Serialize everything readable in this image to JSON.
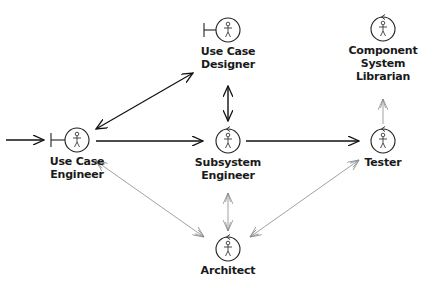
{
  "diagram": {
    "title": "",
    "colors": {
      "strong_line": "#111111",
      "weak_line": "#8a8a8a",
      "text": "#1a1a1a"
    },
    "nodes": [
      {
        "id": "use-case-engineer",
        "label_lines": [
          "Use Case",
          "Engineer"
        ],
        "stereotype": "boundary",
        "cx": 77,
        "cy": 140,
        "label_y": 156
      },
      {
        "id": "use-case-designer",
        "label_lines": [
          "Use Case",
          "Designer"
        ],
        "stereotype": "boundary",
        "cx": 228,
        "cy": 30,
        "label_y": 47
      },
      {
        "id": "subsystem-engineer",
        "label_lines": [
          "Subsystem",
          "Engineer"
        ],
        "stereotype": "control",
        "cx": 228,
        "cy": 141,
        "label_y": 156
      },
      {
        "id": "component-system-librarian",
        "label_lines": [
          "Component",
          "System",
          "Librarian"
        ],
        "stereotype": "control",
        "cx": 383,
        "cy": 29,
        "label_y": 45
      },
      {
        "id": "tester",
        "label_lines": [
          "Tester"
        ],
        "stereotype": "control",
        "cx": 383,
        "cy": 141,
        "label_y": 156
      },
      {
        "id": "architect",
        "label_lines": [
          "Architect"
        ],
        "stereotype": "control",
        "cx": 228,
        "cy": 249,
        "label_y": 264
      }
    ],
    "edges": [
      {
        "from": "external",
        "to": "use-case-engineer",
        "style": "strong",
        "direction": "forward"
      },
      {
        "from": "use-case-engineer",
        "to": "use-case-designer",
        "style": "strong",
        "direction": "both"
      },
      {
        "from": "use-case-engineer",
        "to": "subsystem-engineer",
        "style": "strong",
        "direction": "forward"
      },
      {
        "from": "use-case-designer",
        "to": "subsystem-engineer",
        "style": "strong",
        "direction": "both"
      },
      {
        "from": "subsystem-engineer",
        "to": "tester",
        "style": "strong",
        "direction": "forward"
      },
      {
        "from": "tester",
        "to": "component-system-librarian",
        "style": "weak",
        "direction": "forward"
      },
      {
        "from": "use-case-engineer",
        "to": "architect",
        "style": "weak",
        "direction": "both"
      },
      {
        "from": "subsystem-engineer",
        "to": "architect",
        "style": "weak",
        "direction": "both"
      },
      {
        "from": "tester",
        "to": "architect",
        "style": "weak",
        "direction": "both"
      }
    ]
  },
  "labels": {
    "uce_1": "Use Case",
    "uce_2": "Engineer",
    "ucd_1": "Use Case",
    "ucd_2": "Designer",
    "sse_1": "Subsystem",
    "sse_2": "Engineer",
    "csl_1": "Component",
    "csl_2": "System",
    "csl_3": "Librarian",
    "tester": "Tester",
    "architect": "Architect"
  }
}
